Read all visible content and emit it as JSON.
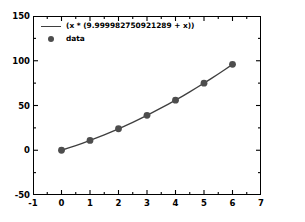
{
  "chart_data": {
    "type": "scatter",
    "title": "",
    "xlabel": "",
    "ylabel": "",
    "xlim": [
      -1,
      7
    ],
    "ylim": [
      -50,
      150
    ],
    "grid": false,
    "legend_position": "upper left",
    "x_ticks": [
      "-1",
      "0",
      "1",
      "2",
      "3",
      "4",
      "5",
      "6",
      "7"
    ],
    "x_tick_values": [
      -1,
      0,
      1,
      2,
      3,
      4,
      5,
      6,
      7
    ],
    "x_minor_ticks": [
      -0.5,
      0.5,
      1.5,
      2.5,
      3.5,
      4.5,
      5.5,
      6.5
    ],
    "y_ticks": [
      "-50",
      "0",
      "50",
      "100",
      "150"
    ],
    "y_tick_values": [
      -50,
      0,
      50,
      100,
      150
    ],
    "y_minor_ticks": [
      -25,
      25,
      75,
      125
    ],
    "series": [
      {
        "name": "(x * (9.999982750921289 + x))",
        "kind": "line",
        "color": "#3f3f3f",
        "x": [
          0,
          0.25,
          0.5,
          0.75,
          1,
          1.25,
          1.5,
          1.75,
          2,
          2.25,
          2.5,
          2.75,
          3,
          3.25,
          3.5,
          3.75,
          4,
          4.25,
          4.5,
          4.75,
          5,
          5.25,
          5.5,
          5.75,
          6
        ],
        "values": [
          0,
          2.5625,
          5.25,
          8.0625,
          11,
          14.0625,
          17.25,
          20.5625,
          24,
          27.5625,
          31.25,
          35.0625,
          39,
          43.0625,
          47.25,
          51.5625,
          56,
          60.5625,
          65.25,
          70.0625,
          75,
          80.0625,
          85.25,
          90.5625,
          96
        ]
      },
      {
        "name": "data",
        "kind": "markers",
        "color": "#4d4d4d",
        "x": [
          0,
          1,
          2,
          3,
          4,
          5,
          6
        ],
        "values": [
          0,
          11,
          24,
          39,
          56,
          75,
          96
        ]
      }
    ],
    "legend_entries": [
      {
        "label": "(x * (9.999982750921289 + x))",
        "marker": "line"
      },
      {
        "label": "data",
        "marker": "circle"
      }
    ]
  },
  "colors": {
    "background": "#ffffff",
    "axis": "#000000",
    "fit_line": "#3f3f3f",
    "marker": "#4d4d4d"
  }
}
